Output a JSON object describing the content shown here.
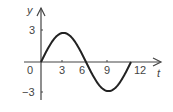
{
  "chart_data": {
    "type": "line",
    "title": "",
    "xlabel": "t",
    "ylabel": "y",
    "origin_label": "0",
    "x_ticks": [
      "3",
      "6",
      "9",
      "12"
    ],
    "y_ticks": [
      "3",
      "-3"
    ],
    "xlim": [
      0,
      12
    ],
    "ylim": [
      -3,
      3
    ],
    "grid": false,
    "series": [
      {
        "name": "y(t)",
        "function": "y = 3 sin(pi t / 6)",
        "x": [
          0,
          1.5,
          3,
          4.5,
          6,
          7.5,
          9,
          10.5,
          12
        ],
        "values": [
          0,
          2.12,
          3,
          2.12,
          0,
          -2.12,
          -3,
          -2.12,
          0
        ]
      }
    ]
  }
}
